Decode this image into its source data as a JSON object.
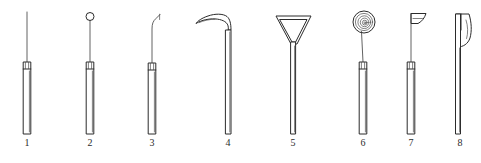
{
  "figure": {
    "background_color": "#ffffff",
    "ink_color": "#2b2b2b",
    "width": 481,
    "height": 163,
    "item_count": 8
  },
  "instruments": [
    {
      "number": "1",
      "name": "straight-fine-probe",
      "tip_description": "long straight needle-like probe",
      "center_x": 27,
      "label_y": 137,
      "handle": {
        "top": 62,
        "bottom": 134,
        "half_width": 4.0,
        "collar_height": 7
      },
      "shaft_top": 12
    },
    {
      "number": "2",
      "name": "ball-ended-probe",
      "tip_description": "small ring or ball terminal on slender shaft",
      "center_x": 90,
      "label_y": 137,
      "handle": {
        "top": 62,
        "bottom": 134,
        "half_width": 4.0,
        "collar_height": 7
      },
      "shaft_top": 20
    },
    {
      "number": "3",
      "name": "angled-hook-explorer",
      "tip_description": "slender shaft with short angled hook at the tip",
      "center_x": 152,
      "label_y": 137,
      "handle": {
        "top": 63,
        "bottom": 134,
        "half_width": 4.0,
        "collar_height": 7
      },
      "shaft_top": 16
    },
    {
      "number": "4",
      "name": "curved-blade-elevator",
      "tip_description": "long shaft with broad sickle-shaped curved blade bending to the left",
      "center_x": 228,
      "label_y": 137,
      "handle": {
        "top": 30,
        "bottom": 134,
        "half_width": 3.0,
        "collar_height": 0
      },
      "shaft_top": 14
    },
    {
      "number": "5",
      "name": "triangular-scaler",
      "tip_description": "shaft topped with a hollow triangular or funnel-shaped working end",
      "center_x": 293,
      "label_y": 137,
      "handle": {
        "top": 46,
        "bottom": 134,
        "half_width": 2.6,
        "collar_height": 0
      },
      "shaft_top": 14
    },
    {
      "number": "6",
      "name": "spiral-disc-burnisher",
      "tip_description": "thin shaft carrying a flat spiral or concentric coiled disc",
      "center_x": 363,
      "label_y": 137,
      "handle": {
        "top": 62,
        "bottom": 134,
        "half_width": 4.0,
        "collar_height": 7
      },
      "shaft_top": 32
    },
    {
      "number": "7",
      "name": "flag-blade-spatula",
      "tip_description": "thin shaft with a small flat flag-like scoop blade at the top",
      "center_x": 411,
      "label_y": 137,
      "handle": {
        "top": 62,
        "bottom": 134,
        "half_width": 4.0,
        "collar_height": 7
      },
      "shaft_top": 14
    },
    {
      "number": "8",
      "name": "broad-chisel-knife",
      "tip_description": "wide flat handle with a broad curved chisel or knife blade",
      "center_x": 460,
      "label_y": 137,
      "handle": {
        "top": 14,
        "bottom": 134,
        "half_width": 4.5,
        "collar_height": 0
      },
      "shaft_top": 14
    }
  ]
}
